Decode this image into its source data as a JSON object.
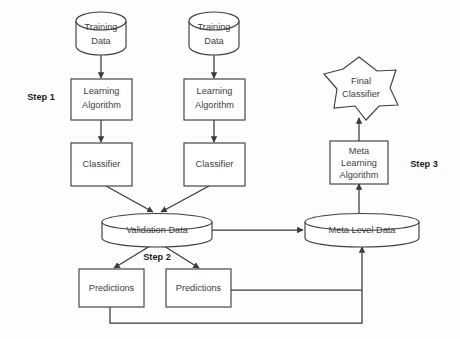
{
  "diagram": {
    "background_color": "#fdfdfd",
    "stroke_color": "#3f3f3f",
    "text_color": "#404040",
    "step_text_color": "#1c1c1c",
    "nodes": {
      "training_data_left": {
        "label_line1": "Training",
        "label_line2": "Data",
        "shape": "cylinder"
      },
      "training_data_right": {
        "label_line1": "Training",
        "label_line2": "Data",
        "shape": "cylinder"
      },
      "learning_algorithm_left": {
        "label_line1": "Learning",
        "label_line2": "Algorithm",
        "shape": "rectangle"
      },
      "learning_algorithm_right": {
        "label_line1": "Learning",
        "label_line2": "Algorithm",
        "shape": "rectangle"
      },
      "classifier_left": {
        "label_line1": "Classifier",
        "shape": "rectangle"
      },
      "classifier_right": {
        "label_line1": "Classifier",
        "shape": "rectangle"
      },
      "validation_data": {
        "label_line1": "Validation Data",
        "shape": "cylinder"
      },
      "predictions_left": {
        "label_line1": "Predictions",
        "shape": "rectangle"
      },
      "predictions_right": {
        "label_line1": "Predictions",
        "shape": "rectangle"
      },
      "meta_level_data": {
        "label_line1": "Meta Level Data",
        "shape": "cylinder"
      },
      "meta_learning_algorithm": {
        "label_line1": "Meta",
        "label_line2": "Learning",
        "label_line3": "Algorithm",
        "shape": "rectangle"
      },
      "final_classifier": {
        "label_line1": "Final",
        "label_line2": "Classifier",
        "shape": "star-burst"
      }
    },
    "step_labels": {
      "step1": "Step 1",
      "step2": "Step 2",
      "step3": "Step 3"
    }
  }
}
